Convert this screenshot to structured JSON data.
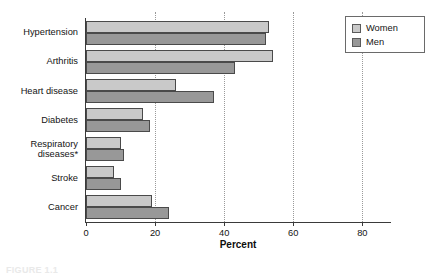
{
  "chart_data": {
    "type": "bar",
    "orientation": "horizontal",
    "title": "",
    "xlabel": "Percent",
    "ylabel": "",
    "xlim": [
      0,
      88
    ],
    "xticks": [
      0,
      20,
      40,
      60,
      80
    ],
    "xtick_labels": [
      "0",
      "20",
      "40",
      "60",
      "80"
    ],
    "grid": "vertical-dotted",
    "legend_position": "top-right",
    "categories": [
      "Hypertension",
      "Arthritis",
      "Heart disease",
      "Diabetes",
      "Respiratory\ndiseases*",
      "Stroke",
      "Cancer"
    ],
    "series": [
      {
        "name": "Women",
        "color": "#c9c9c9",
        "values": [
          53,
          54,
          26,
          16.5,
          10,
          8,
          19
        ]
      },
      {
        "name": "Men",
        "color": "#989898",
        "values": [
          52,
          43,
          37,
          18.5,
          11,
          10,
          24
        ]
      }
    ]
  },
  "legend": {
    "entries": [
      {
        "label": "Women",
        "swatch": "women"
      },
      {
        "label": "Men",
        "swatch": "men"
      }
    ]
  },
  "axis": {
    "x_title": "Percent"
  },
  "caption": {
    "text": "FIGURE 1.1"
  }
}
